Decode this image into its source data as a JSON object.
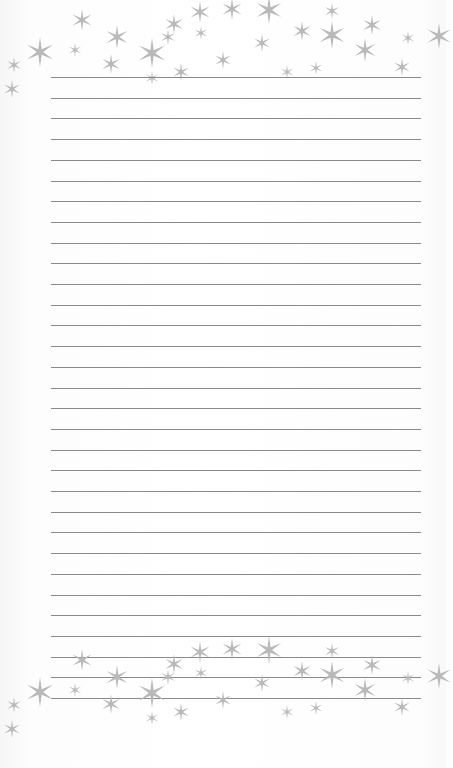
{
  "page": {
    "type": "lined-notepaper",
    "background": "#fdfdfd",
    "line_color": "#8a8a8a",
    "star_color": "#b9b9b9",
    "line_left": 51,
    "line_right": 421,
    "line_first_y": 77,
    "line_spacing": 20.7,
    "line_count": 31
  },
  "stars": [
    {
      "x": 40,
      "y": 52,
      "r": 15
    },
    {
      "x": 14,
      "y": 65,
      "r": 8
    },
    {
      "x": 12,
      "y": 89,
      "r": 9
    },
    {
      "x": 82,
      "y": 20,
      "r": 11
    },
    {
      "x": 75,
      "y": 50,
      "r": 7
    },
    {
      "x": 117,
      "y": 37,
      "r": 12
    },
    {
      "x": 111,
      "y": 64,
      "r": 10
    },
    {
      "x": 152,
      "y": 53,
      "r": 15
    },
    {
      "x": 152,
      "y": 78,
      "r": 7
    },
    {
      "x": 181,
      "y": 72,
      "r": 9
    },
    {
      "x": 168,
      "y": 37,
      "r": 8
    },
    {
      "x": 174,
      "y": 24,
      "r": 10
    },
    {
      "x": 200,
      "y": 12,
      "r": 11
    },
    {
      "x": 201,
      "y": 33,
      "r": 7
    },
    {
      "x": 232,
      "y": 9,
      "r": 11
    },
    {
      "x": 269,
      "y": 10,
      "r": 14
    },
    {
      "x": 262,
      "y": 43,
      "r": 9
    },
    {
      "x": 302,
      "y": 31,
      "r": 10
    },
    {
      "x": 332,
      "y": 11,
      "r": 8
    },
    {
      "x": 332,
      "y": 35,
      "r": 14
    },
    {
      "x": 372,
      "y": 25,
      "r": 10
    },
    {
      "x": 365,
      "y": 50,
      "r": 12
    },
    {
      "x": 408,
      "y": 38,
      "r": 7
    },
    {
      "x": 402,
      "y": 67,
      "r": 9
    },
    {
      "x": 439,
      "y": 36,
      "r": 13
    },
    {
      "x": 287,
      "y": 72,
      "r": 7
    },
    {
      "x": 316,
      "y": 68,
      "r": 7
    },
    {
      "x": 223,
      "y": 60,
      "r": 9
    }
  ],
  "bottom_star_offset": 640
}
